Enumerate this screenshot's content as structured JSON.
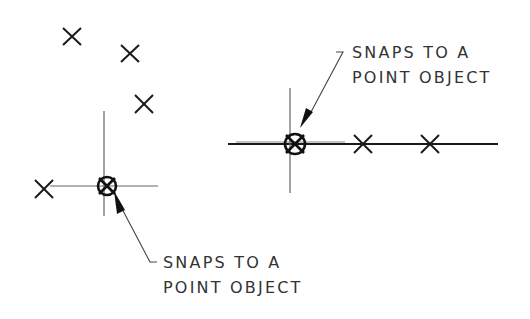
{
  "diagram": {
    "left_example": {
      "label_line1": "SNAPS TO A",
      "label_line2": "POINT OBJECT",
      "point_markers": [
        {
          "x": 72,
          "y": 37
        },
        {
          "x": 130,
          "y": 54
        },
        {
          "x": 144,
          "y": 104
        },
        {
          "x": 44,
          "y": 189
        }
      ],
      "snap_marker": {
        "x": 106,
        "y": 186
      }
    },
    "right_example": {
      "label_line1": "SNAPS TO A",
      "label_line2": "POINT OBJECT",
      "point_markers": [
        {
          "x": 363,
          "y": 144
        },
        {
          "x": 430,
          "y": 144
        }
      ],
      "snap_marker": {
        "x": 295,
        "y": 144
      }
    },
    "colors": {
      "stroke": "#1a1a1a",
      "crosshair": "#555555",
      "text": "#333333"
    }
  }
}
